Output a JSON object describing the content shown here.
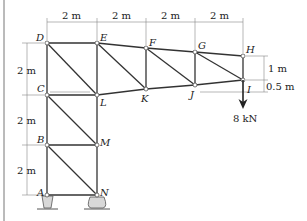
{
  "figure": {
    "type": "truss",
    "nodes": {
      "A": {
        "label": "A"
      },
      "B": {
        "label": "B"
      },
      "C": {
        "label": "C"
      },
      "D": {
        "label": "D"
      },
      "E": {
        "label": "E"
      },
      "F": {
        "label": "F"
      },
      "G": {
        "label": "G"
      },
      "H": {
        "label": "H"
      },
      "I": {
        "label": "I"
      },
      "J": {
        "label": "J"
      },
      "K": {
        "label": "K"
      },
      "L": {
        "label": "L"
      },
      "M": {
        "label": "M"
      },
      "N": {
        "label": "N"
      }
    },
    "dimensions": {
      "top_1": "2 m",
      "top_2": "2 m",
      "top_3": "2 m",
      "top_4": "2 m",
      "left_1": "2 m",
      "left_2": "2 m",
      "left_3": "2 m",
      "right_1": "1 m",
      "right_2": "0.5 m"
    },
    "load": {
      "label": "8 kN",
      "node": "I",
      "direction": "down"
    },
    "colors": {
      "member": "#333333",
      "dimension": "#888888",
      "support": "#d8d8d8"
    }
  }
}
